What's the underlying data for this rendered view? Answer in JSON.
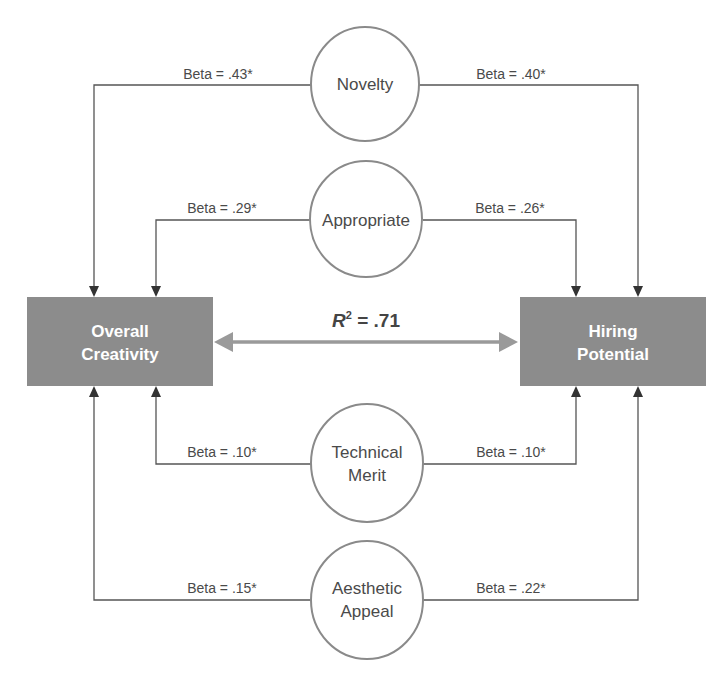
{
  "outcomes": {
    "left": {
      "label_lines": [
        "Overall",
        "Creativity"
      ]
    },
    "right": {
      "label_lines": [
        "Hiring",
        "Potential"
      ]
    }
  },
  "correlation": {
    "symbol": "R",
    "superscript": "2",
    "value": " = .71"
  },
  "predictors": [
    {
      "id": "novelty",
      "label_lines": [
        "Novelty"
      ],
      "beta_left": "Beta = .43*",
      "beta_right": "Beta = .40*"
    },
    {
      "id": "appropriate",
      "label_lines": [
        "Appropriate"
      ],
      "beta_left": "Beta = .29*",
      "beta_right": "Beta = .26*"
    },
    {
      "id": "technical-merit",
      "label_lines": [
        "Technical",
        "Merit"
      ],
      "beta_left": "Beta = .10*",
      "beta_right": "Beta = .10*"
    },
    {
      "id": "aesthetic-appeal",
      "label_lines": [
        "Aesthetic",
        "Appeal"
      ],
      "beta_left": "Beta = .15*",
      "beta_right": "Beta = .22*"
    }
  ],
  "colors": {
    "box_fill": "#8c8c8c",
    "arrow": "#555555",
    "double_arrow": "#9a9a9a",
    "ellipse_stroke": "#8a8a8a"
  }
}
